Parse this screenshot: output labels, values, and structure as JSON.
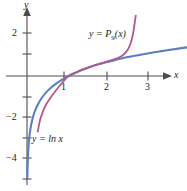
{
  "figure": {
    "background": "#ffffff",
    "axis_color": "#4d4d4d",
    "text_color": "#231f20"
  },
  "axes": {
    "x_axis_label": "x",
    "y_axis_label": "y",
    "x_ticks": [
      "1",
      "2",
      "3"
    ],
    "y_ticks": [
      "2",
      "−2",
      "−4"
    ]
  },
  "labels": {
    "poly": {
      "prefix": "y = P",
      "subscript": "9",
      "suffix": "(x)"
    },
    "ln": {
      "text": "y = ln x"
    }
  },
  "chart_data": {
    "type": "line",
    "title": "",
    "xlabel": "x",
    "ylabel": "y",
    "xlim": [
      -0.1,
      3.9
    ],
    "ylim": [
      -5.2,
      2.9
    ],
    "grid": false,
    "legend": "inline-annotations",
    "x_ticks": [
      1,
      2,
      3
    ],
    "y_ticks": [
      2,
      -2,
      -4
    ],
    "series": [
      {
        "name": "y = ln x",
        "color": "#5b7fbe",
        "x": [
          0.008,
          0.012,
          0.02,
          0.03,
          0.05,
          0.08,
          0.12,
          0.18,
          0.25,
          0.35,
          0.5,
          0.7,
          0.9,
          1.0,
          1.2,
          1.5,
          1.8,
          2.0,
          2.4,
          2.8,
          3.2,
          3.6,
          3.85
        ],
        "y": [
          -4.83,
          -4.42,
          -3.91,
          -3.51,
          -3.0,
          -2.53,
          -2.12,
          -1.71,
          -1.39,
          -1.05,
          -0.69,
          -0.36,
          -0.11,
          0.0,
          0.18,
          0.41,
          0.59,
          0.69,
          0.88,
          1.03,
          1.16,
          1.28,
          1.35
        ]
      },
      {
        "name": "y = P9(x)",
        "color": "#b5568c",
        "description": "9th-degree Taylor polynomial of ln x centered at x = 1; matches ln x near x = 1 and diverges sharply beyond x ≈ 2.4 and below x ≈ 0.25",
        "x": [
          0.26,
          0.3,
          0.36,
          0.45,
          0.55,
          0.7,
          0.85,
          1.0,
          1.2,
          1.5,
          1.75,
          1.95,
          2.1,
          2.2,
          2.3,
          2.4,
          2.48,
          2.54,
          2.58,
          2.62
        ],
        "y": [
          -2.62,
          -2.2,
          -1.8,
          -1.38,
          -1.07,
          -0.67,
          -0.32,
          0.0,
          0.19,
          0.42,
          0.58,
          0.69,
          0.78,
          0.86,
          0.97,
          1.16,
          1.45,
          1.85,
          2.3,
          2.85
        ]
      }
    ]
  }
}
